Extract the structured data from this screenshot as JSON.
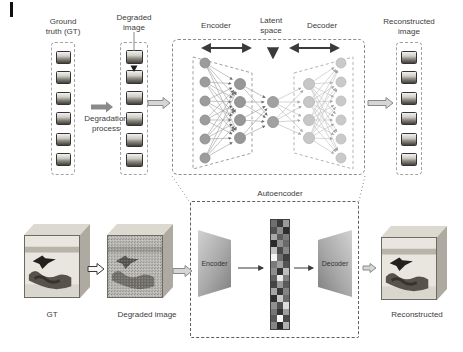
{
  "top": {
    "gt_label_1": "Ground",
    "gt_label_2": "truth (GT)",
    "degraded_label_1": "Degraded",
    "degraded_label_2": "image",
    "degradation_label_1": "Degradation",
    "degradation_label_2": "process",
    "encoder_label": "Encoder",
    "latent_label_1": "Latent",
    "latent_label_2": "space",
    "decoder_label": "Decoder",
    "reconstructed_label_1": "Reconstructed",
    "reconstructed_label_2": "image",
    "autoencoder_label": "Autoencoder"
  },
  "bottom": {
    "gt_label": "GT",
    "degraded_label": "Degraded image",
    "encoder_label": "Encoder",
    "decoder_label": "Decoder",
    "reconstructed_label": "Reconstructed"
  },
  "thumbnails": {
    "gt": 6,
    "degraded": 6,
    "reconstructed": 6
  },
  "network": {
    "layers": [
      {
        "name": "input",
        "nodes": 6
      },
      {
        "name": "encoder-hidden",
        "nodes": 4
      },
      {
        "name": "latent",
        "nodes": 2
      },
      {
        "name": "decoder-hidden",
        "nodes": 4
      },
      {
        "name": "output",
        "nodes": 6
      }
    ]
  },
  "latent_vector": {
    "cols": 3,
    "rows": 16,
    "cells": [
      "#6f6f6f",
      "#3a3a3a",
      "#9a9a9a",
      "#515151",
      "#8c8c8c",
      "#2e2e2e",
      "#a8a8a8",
      "#5d5d5d",
      "#7d7d7d",
      "#2b2b2b",
      "#909090",
      "#6a6a6a",
      "#c2c2c2",
      "#4a4a4a",
      "#888888",
      "#f4f4f4",
      "#6e6e6e",
      "#3f3f3f",
      "#7a7a7a",
      "#a0a0a0",
      "#545454",
      "#8e8e8e",
      "#333333",
      "#bdbdbd",
      "#616161",
      "#ececec",
      "#7f7f7f",
      "#454545",
      "#969696",
      "#5a5a5a",
      "#a5a5a5",
      "#383838",
      "#848484",
      "#2f2f2f",
      "#c9c9c9",
      "#6b6b6b",
      "#909090",
      "#4f4f4f",
      "#dcdcdc",
      "#757575",
      "#353535",
      "#9e9e9e",
      "#585858",
      "#f8f8f8",
      "#494949",
      "#868686",
      "#2a2a2a",
      "#b0b0b0"
    ]
  },
  "colors": {
    "encoder_node": "#9c9c9c",
    "decoder_node": "#c9c9c9",
    "latent_node": "#a1a1a1",
    "dashed_border": "#8c8c8c",
    "arrow_dark": "#3a3a3a",
    "block_arrow_fill": "#d6d6d6",
    "block_arrow_solid": "#8a8a8a"
  }
}
